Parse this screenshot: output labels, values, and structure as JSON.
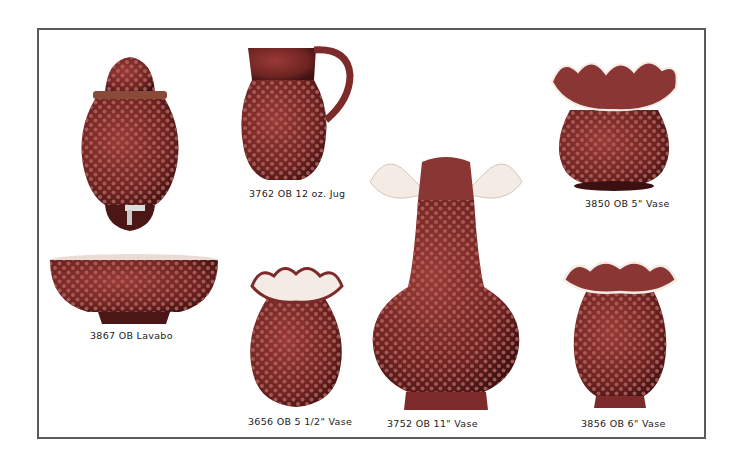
{
  "catalog": {
    "items": [
      {
        "id": "dispenser",
        "caption": ""
      },
      {
        "id": "jug",
        "caption": "3762 OB 12 oz. Jug"
      },
      {
        "id": "vase_5",
        "caption": "3850 OB 5\" Vase"
      },
      {
        "id": "lavabo",
        "caption": "3867 OB Lavabo"
      },
      {
        "id": "vase_5_half",
        "caption": "3656 OB 5 1/2\" Vase"
      },
      {
        "id": "vase_11",
        "caption": "3752 OB 11\" Vase"
      },
      {
        "id": "vase_6",
        "caption": "3856 OB 6\" Vase"
      }
    ]
  },
  "colors": {
    "glass": "#7d2b2a",
    "glass_dark": "#4a1616",
    "hobnail": "#b0605a",
    "opalescent": "#f4ece4",
    "frame_border": "#5a5a5a"
  }
}
